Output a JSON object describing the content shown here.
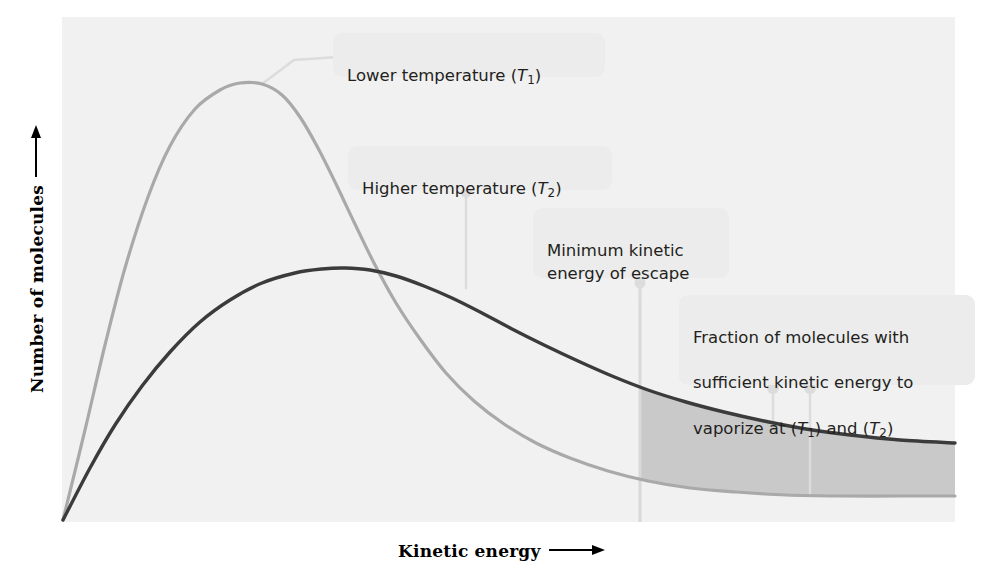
{
  "figure": {
    "background_color": "#ffffff",
    "plot_background_color": "#f1f1f1"
  },
  "axes": {
    "y_label": "Number of molecules",
    "x_label": "Kinetic energy",
    "y_arrow_icon": "up-arrow-icon",
    "x_arrow_icon": "right-arrow-icon"
  },
  "callouts": {
    "lower_temperature": {
      "text": "Lower temperature (T1)",
      "line1": "Lower temperature (",
      "symbol": "T",
      "sub": "1",
      "line2": ")"
    },
    "higher_temperature": {
      "line1": "Higher temperature (",
      "symbol": "T",
      "sub": "2",
      "line2": ")"
    },
    "minimum_energy": {
      "text": "Minimum kinetic\nenergy of escape"
    },
    "fraction": {
      "line1": "Fraction of molecules with",
      "line2": "sufficient kinetic energy to",
      "line3_a": "vaporize at  (",
      "line3_t1": "T",
      "line3_sub1": "1",
      "line3_b": ") and  (",
      "line3_t2": "T",
      "line3_sub2": "2",
      "line3_c": ")"
    }
  },
  "chart_data": {
    "type": "line",
    "title": "",
    "xlabel": "Kinetic energy",
    "ylabel": "Number of molecules",
    "grid": false,
    "legend": "none",
    "axis_ticks": "none",
    "plot_area_px": {
      "x": 62,
      "y": 17,
      "width": 893,
      "height": 505
    },
    "minimum_escape_energy_x_px": 640,
    "series": [
      {
        "name": "Lower temperature (T1)",
        "color": "#a9a9a9",
        "stroke_width": 3.2,
        "peak_px": {
          "x": 262,
          "y": 84
        },
        "points_px": [
          [
            63,
            520
          ],
          [
            85,
            430
          ],
          [
            105,
            345
          ],
          [
            125,
            268
          ],
          [
            148,
            197
          ],
          [
            170,
            146
          ],
          [
            195,
            109
          ],
          [
            220,
            90
          ],
          [
            240,
            83
          ],
          [
            262,
            84
          ],
          [
            282,
            95
          ],
          [
            300,
            117
          ],
          [
            318,
            148
          ],
          [
            336,
            184
          ],
          [
            354,
            222
          ],
          [
            374,
            263
          ],
          [
            396,
            303
          ],
          [
            420,
            339
          ],
          [
            446,
            373
          ],
          [
            474,
            401
          ],
          [
            504,
            424
          ],
          [
            536,
            443
          ],
          [
            570,
            458
          ],
          [
            608,
            471
          ],
          [
            648,
            481
          ],
          [
            690,
            488
          ],
          [
            736,
            492
          ],
          [
            786,
            495
          ],
          [
            840,
            496
          ],
          [
            900,
            496
          ],
          [
            955,
            496
          ]
        ]
      },
      {
        "name": "Higher temperature (T2)",
        "color": "#3b3b3b",
        "stroke_width": 3.4,
        "peak_px": {
          "x": 345,
          "y": 268
        },
        "points_px": [
          [
            63,
            520
          ],
          [
            90,
            468
          ],
          [
            115,
            425
          ],
          [
            142,
            386
          ],
          [
            170,
            352
          ],
          [
            200,
            322
          ],
          [
            230,
            300
          ],
          [
            262,
            283
          ],
          [
            295,
            273
          ],
          [
            322,
            269
          ],
          [
            345,
            268
          ],
          [
            370,
            270
          ],
          [
            396,
            276
          ],
          [
            424,
            286
          ],
          [
            452,
            298
          ],
          [
            482,
            313
          ],
          [
            512,
            329
          ],
          [
            544,
            345
          ],
          [
            578,
            361
          ],
          [
            612,
            376
          ],
          [
            648,
            390
          ],
          [
            686,
            402
          ],
          [
            724,
            412
          ],
          [
            764,
            421
          ],
          [
            806,
            429
          ],
          [
            850,
            435
          ],
          [
            900,
            440
          ],
          [
            955,
            443
          ]
        ]
      }
    ],
    "shaded_region": {
      "label": "Fraction of molecules with sufficient kinetic energy to vaporize",
      "fill_color": "#c9c9c9",
      "x_start_px": 640,
      "x_end_px": 955,
      "upper_bound_series": "Higher temperature (T2)",
      "lower_bound_series": "Lower temperature (T1)"
    },
    "vertical_marker": {
      "label": "Minimum kinetic energy of escape",
      "x_px": 640,
      "y_top_px": 282,
      "y_bottom_px": 522,
      "color": "#d8d8d8"
    },
    "connectors": [
      {
        "from": "callout-lower",
        "to_px": [
          262,
          84
        ]
      },
      {
        "from": "callout-higher",
        "to_px": [
          466,
          288
        ]
      },
      {
        "from": "callout-min",
        "to_px": [
          640,
          282
        ]
      },
      {
        "from": "callout-frac",
        "to_px": [
          773,
          420
        ]
      },
      {
        "from": "callout-frac",
        "to_px": [
          810,
          493
        ]
      }
    ]
  }
}
